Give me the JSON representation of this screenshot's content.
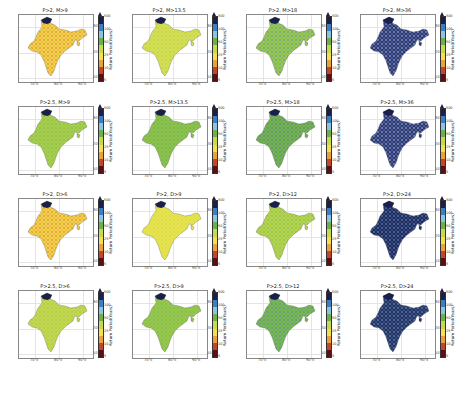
{
  "figure": {
    "colorbar_label": "Return Period(Years)",
    "colorbar_ticks": [
      "500",
      "100",
      "50",
      "25",
      "10",
      "5"
    ],
    "colorbar_colors": [
      "#1b1f4b",
      "#3a7fc2",
      "#8dc3e0",
      "#6ab04c",
      "#c8d94a",
      "#f4e04d",
      "#e8a23a",
      "#c5442c",
      "#5a0f14"
    ],
    "lat_labels": [
      "30°N",
      "20°N",
      "10°N"
    ],
    "lon_labels": [
      "70°E",
      "80°E",
      "90°E"
    ]
  },
  "chart_data": {
    "type": "heatmap",
    "layout": {
      "rows": 4,
      "cols": 4,
      "grid": true,
      "legend_position": "right of each panel (colorbar)"
    },
    "colorbar": {
      "label": "Return Period(Years)",
      "ticks": [
        5,
        10,
        25,
        50,
        100,
        500
      ],
      "extend": "max"
    },
    "xaxis": {
      "ticks": [
        "70°E",
        "80°E",
        "90°E"
      ]
    },
    "yaxis": {
      "ticks": [
        "10°N",
        "20°N",
        "30°N"
      ]
    },
    "panels": [
      {
        "title": "P>2, M>9",
        "dominant": "yellow/orange (10-25 yr), red patches central India"
      },
      {
        "title": "P>2, M>13.5",
        "dominant": "yellow-green (25-50 yr)"
      },
      {
        "title": "P>2, M>18",
        "dominant": "green (50 yr) with blue patches"
      },
      {
        "title": "P>2, M>36",
        "dominant": "dark blue (>100-500 yr) with white/light areas"
      },
      {
        "title": "P>2.5, M>9",
        "dominant": "green/yellow-green (25-50 yr)"
      },
      {
        "title": "P>2.5, M>13.5",
        "dominant": "green (50 yr)"
      },
      {
        "title": "P>2.5, M>18",
        "dominant": "green with blue (50-100 yr)"
      },
      {
        "title": "P>2.5, M>36",
        "dominant": "dark blue with white areas (>100 yr)"
      },
      {
        "title": "P>2, D>6",
        "dominant": "yellow/orange (10-25 yr), red patches"
      },
      {
        "title": "P>2, D>9",
        "dominant": "yellow (25 yr)"
      },
      {
        "title": "P>2, D>12",
        "dominant": "yellow-green (25-50 yr)"
      },
      {
        "title": "P>2, D>24",
        "dominant": "dark blue (>100 yr)"
      },
      {
        "title": "P>2.5, D>6",
        "dominant": "yellow-green (25-50 yr)"
      },
      {
        "title": "P>2.5, D>9",
        "dominant": "green (50 yr)"
      },
      {
        "title": "P>2.5, D>12",
        "dominant": "green with blue patches"
      },
      {
        "title": "P>2.5, D>24",
        "dominant": "dark blue (>100 yr)"
      }
    ]
  },
  "panels": [
    {
      "title": "P>2, M>9",
      "fill": "#f0d54a",
      "accent": "#d0582c",
      "north": "#1b1f4b"
    },
    {
      "title": "P>2, M>13.5",
      "fill": "#d9df52",
      "accent": "#9bc94a",
      "north": "#1b1f4b"
    },
    {
      "title": "P>2, M>18",
      "fill": "#9cc94a",
      "accent": "#3a7fc2",
      "north": "#1b1f4b"
    },
    {
      "title": "P>2, M>36",
      "fill": "#2a3a78",
      "accent": "#e6ecef",
      "north": "#1b1f4b"
    },
    {
      "title": "P>2.5, M>9",
      "fill": "#a9cf4c",
      "accent": "#6ab04c",
      "north": "#1b1f4b"
    },
    {
      "title": "P>2.5, M>13.5",
      "fill": "#8ec44c",
      "accent": "#5aa04a",
      "north": "#1b1f4b"
    },
    {
      "title": "P>2.5, M>18",
      "fill": "#78b44c",
      "accent": "#3a6fa2",
      "north": "#1b1f4b"
    },
    {
      "title": "P>2.5, M>36",
      "fill": "#2a3a78",
      "accent": "#e6ecef",
      "north": "#1b1f4b"
    },
    {
      "title": "P>2, D>6",
      "fill": "#f0d54a",
      "accent": "#d0582c",
      "north": "#1b1f4b"
    },
    {
      "title": "P>2, D>9",
      "fill": "#e8e34c",
      "accent": "#c8d94a",
      "north": "#1b1f4b"
    },
    {
      "title": "P>2, D>12",
      "fill": "#b6d44e",
      "accent": "#6ab04c",
      "north": "#1b1f4b"
    },
    {
      "title": "P>2, D>24",
      "fill": "#1f2a60",
      "accent": "#8dc3e0",
      "north": "#1b1f4b"
    },
    {
      "title": "P>2.5, D>6",
      "fill": "#c6d84e",
      "accent": "#8cc04a",
      "north": "#1b1f4b"
    },
    {
      "title": "P>2.5, D>9",
      "fill": "#98c84c",
      "accent": "#6ab04c",
      "north": "#1b1f4b"
    },
    {
      "title": "P>2.5, D>12",
      "fill": "#7cb84c",
      "accent": "#3a7fc2",
      "north": "#1b1f4b"
    },
    {
      "title": "P>2.5, D>24",
      "fill": "#243266",
      "accent": "#8dc3e0",
      "north": "#1b1f4b"
    }
  ]
}
